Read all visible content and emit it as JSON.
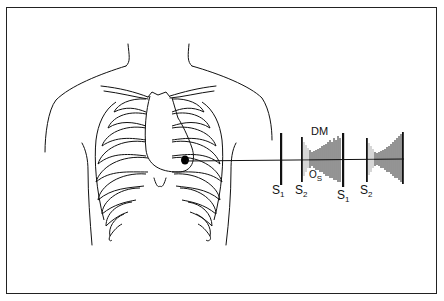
{
  "diagram": {
    "auscultation_point": "apex",
    "labels": {
      "s1_first": {
        "base": "S",
        "sub": "1"
      },
      "s2_first": {
        "base": "S",
        "sub": "2"
      },
      "os": {
        "base": "O",
        "sub": "S"
      },
      "dm": "DM",
      "s1_second": {
        "base": "S",
        "sub": "1"
      },
      "s2_second": {
        "base": "S",
        "sub": "2"
      }
    },
    "colors": {
      "line": "#111111",
      "background": "#ffffff",
      "border": "#222222"
    }
  }
}
